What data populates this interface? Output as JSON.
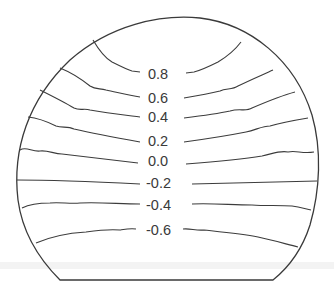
{
  "figure": {
    "type": "contour-diagram",
    "outline_color": "#3a3a3a",
    "line_color": "#3c3c3c",
    "label_color": "#3a3a3a"
  },
  "contours": [
    {
      "label": "0.8",
      "label_x": 148,
      "label_y": 79
    },
    {
      "label": "0.6",
      "label_x": 148,
      "label_y": 103
    },
    {
      "label": "0.4",
      "label_x": 148,
      "label_y": 122
    },
    {
      "label": "0.2",
      "label_x": 148,
      "label_y": 146
    },
    {
      "label": "0.0",
      "label_x": 148,
      "label_y": 166
    },
    {
      "label": "-0.2",
      "label_x": 146,
      "label_y": 188
    },
    {
      "label": "-0.4",
      "label_x": 146,
      "label_y": 210
    },
    {
      "label": "-0.6",
      "label_x": 146,
      "label_y": 235
    }
  ]
}
